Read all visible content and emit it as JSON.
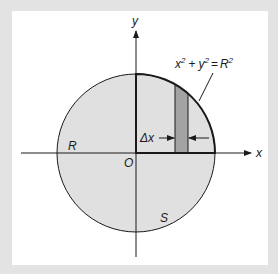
{
  "figure": {
    "equation": {
      "base_x": "x",
      "plus": "+",
      "base_y": "y",
      "equals": "=",
      "base_r": "R",
      "exp": "2"
    },
    "labels": {
      "y_axis": "y",
      "x_axis": "x",
      "origin": "O",
      "radius": "R",
      "region": "S",
      "delta": "Δx"
    },
    "circle": {
      "cx": 136,
      "cy": 153,
      "r": 79
    },
    "strip": {
      "x_left": 175,
      "x_right": 188
    },
    "colors": {
      "background_frame": "#e3e3e3",
      "panel": "#ffffff",
      "disk_fill": "#e0e0e0",
      "strip_fill": "#a3a3a3",
      "stroke": "#1a1a1a"
    }
  }
}
